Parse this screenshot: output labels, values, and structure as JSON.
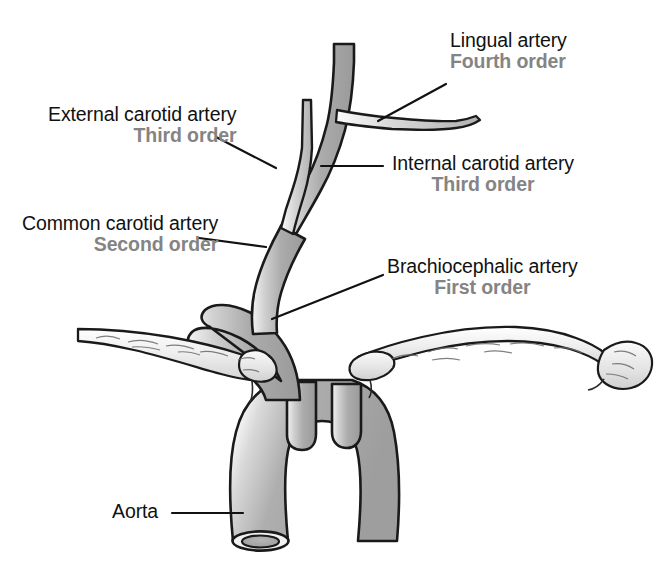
{
  "figure": {
    "background_color": "#ffffff",
    "vessel_fill_color": "#a8a8a8",
    "vessel_outline_color": "#1a1a1a",
    "bone_fill_color": "#e9e9e9",
    "label_text_color": "#111111",
    "order_text_color": "#848484",
    "leader_line_color": "#111111"
  },
  "labels": [
    {
      "id": "lingual",
      "name": "Lingual artery",
      "order": "Fourth order",
      "order_align": "left",
      "leader": {
        "from_x": 446,
        "from_y": 84,
        "to_x": 378,
        "to_y": 121
      }
    },
    {
      "id": "external-carotid",
      "name": "External carotid artery",
      "order": "Third order",
      "order_align": "right",
      "leader": {
        "from_x": 216,
        "from_y": 137,
        "to_x": 276,
        "to_y": 168
      }
    },
    {
      "id": "internal-carotid",
      "name": "Internal carotid artery",
      "order": "Third order",
      "order_align": "center",
      "leader": {
        "from_x": 383,
        "from_y": 166,
        "to_x": 321,
        "to_y": 166
      }
    },
    {
      "id": "common-carotid",
      "name": "Common carotid artery",
      "order": "Second order",
      "order_align": "right",
      "leader": {
        "from_x": 199,
        "from_y": 238,
        "to_x": 266,
        "to_y": 247
      }
    },
    {
      "id": "brachiocephalic",
      "name": "Brachiocephalic artery",
      "order": "First order",
      "order_align": "center",
      "leader": {
        "from_x": 383,
        "from_y": 275,
        "to_x": 272,
        "to_y": 319
      }
    },
    {
      "id": "aorta",
      "name": "Aorta",
      "order": "",
      "order_align": "left",
      "leader": {
        "from_x": 172,
        "from_y": 513,
        "to_x": 243,
        "to_y": 513
      }
    }
  ],
  "anatomy": {
    "vessels": [
      "aorta",
      "brachiocephalic-artery",
      "common-carotid-artery",
      "internal-carotid-artery",
      "external-carotid-artery",
      "lingual-artery",
      "left-common-carotid-artery",
      "left-subclavian-artery"
    ],
    "bones": [
      "left-clavicle",
      "right-clavicle"
    ]
  }
}
